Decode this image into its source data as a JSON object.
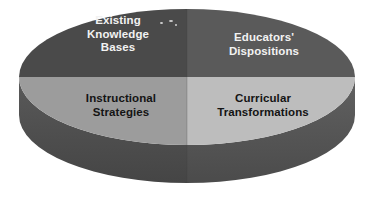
{
  "diagram": {
    "type": "four-quadrant-cylinder",
    "shape": "3d-cylinder-pie",
    "background_color": "#ffffff",
    "geometry": {
      "center_x": 187,
      "center_y": 77,
      "radius_x": 168,
      "radius_y": 68,
      "depth": 38
    },
    "quadrants": [
      {
        "id": "existing-knowledge-bases",
        "position": "top-left",
        "label": "Existing\nKnowledge\nBases",
        "fill_color": "#4a4a4a",
        "text_color": "#f2f2f2"
      },
      {
        "id": "educators-dispositions",
        "position": "top-right",
        "label": "Educators'\nDispositions",
        "fill_color": "#5a5a5a",
        "text_color": "#f2f2f2"
      },
      {
        "id": "instructional-strategies",
        "position": "bottom-left",
        "label": "Instructional\nStrategies",
        "fill_color": "#9c9c9c",
        "text_color": "#141414"
      },
      {
        "id": "curricular-transformations",
        "position": "bottom-right",
        "label": "Curricular\nTransformations",
        "fill_color": "#bdbdbd",
        "text_color": "#141414"
      }
    ],
    "side_wall": {
      "left_color": "#4f4f4f",
      "right_color": "#565656"
    }
  }
}
